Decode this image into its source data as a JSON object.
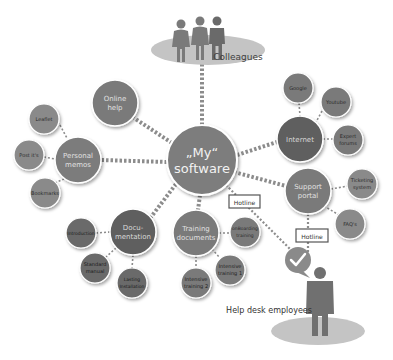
{
  "diagram": {
    "center": {
      "line1": "„My“",
      "line2": "software"
    },
    "colleagues": {
      "label": "Colleagues"
    },
    "help_desk": {
      "label": "Help desk employees"
    },
    "hotline_1": {
      "label": "Hotline"
    },
    "hotline_2": {
      "label": "Hotline"
    },
    "online_help": {
      "line1": "Online",
      "line2": "help"
    },
    "personal_memos": {
      "line1": "Personal",
      "line2": "memos",
      "children": [
        {
          "line1": "Leaflet",
          "line2": ""
        },
        {
          "line1": "Post it's",
          "line2": ""
        },
        {
          "line1": "Bookmarks",
          "line2": ""
        }
      ]
    },
    "internet": {
      "line1": "Internet",
      "line2": "",
      "children": [
        {
          "line1": "Google",
          "line2": ""
        },
        {
          "line1": "Youtube",
          "line2": ""
        },
        {
          "line1": "Expert",
          "line2": "forums"
        }
      ]
    },
    "support_portal": {
      "line1": "Support",
      "line2": "portal",
      "children": [
        {
          "line1": "Ticketing",
          "line2": "system"
        },
        {
          "line1": "FAQ's",
          "line2": ""
        }
      ]
    },
    "documentation": {
      "line1": "Docu-",
      "line2": "mentation",
      "children": [
        {
          "line1": "Introduction",
          "line2": ""
        },
        {
          "line1": "Standard",
          "line2": "manual"
        },
        {
          "line1": "Lasting",
          "line2": "Installation"
        }
      ]
    },
    "training_documents": {
      "line1": "Training",
      "line2": "documents",
      "children": [
        {
          "line1": "onBoarding",
          "line2": "training"
        },
        {
          "line1": "Intensive",
          "line2": "training 1"
        },
        {
          "line1": "Intensive",
          "line2": "training 2"
        }
      ]
    },
    "colors": {
      "main_node": "#7a7a7a",
      "dark_node": "#5f5f5f",
      "child_node": "#8a8a8a",
      "node_border": "#ffffff",
      "connector": "#8c8c8c",
      "platform": "#c4c4c4",
      "person": "#6e6e6e"
    }
  }
}
